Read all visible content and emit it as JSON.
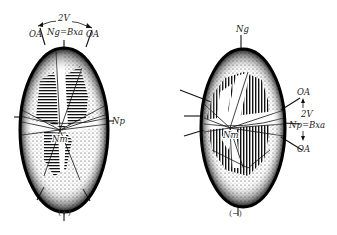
{
  "diagram": {
    "figures": [
      {
        "id": "positive",
        "sign_label": "(+)",
        "labels": {
          "angle": "2V",
          "optic_axis_left": "OA",
          "optic_axis_right": "OA",
          "acute_bisectrix": "Ng=Bxa",
          "np_axis": "Np",
          "nm_axis": "Nm"
        }
      },
      {
        "id": "negative",
        "sign_label": "(−)",
        "labels": {
          "top_axis": "Ng",
          "optic_axis_top": "OA",
          "angle": "2V",
          "acute_bisectrix": "Np=Bxa",
          "optic_axis_bottom": "OA",
          "nm_axis": "Nm"
        }
      }
    ],
    "colors": {
      "ink": "#111111",
      "background": "#ffffff"
    }
  }
}
